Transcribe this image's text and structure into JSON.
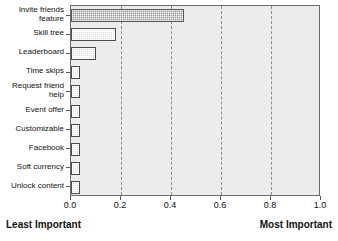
{
  "chart_data": {
    "type": "bar",
    "orientation": "horizontal",
    "title": "",
    "xlabel": "",
    "ylabel": "",
    "xlim": [
      0.0,
      1.0
    ],
    "grid": "vertical-dashed",
    "legend": "none",
    "xticks": [
      "0.0",
      "0.2",
      "0.4",
      "0.6",
      "0.8",
      "1.0"
    ],
    "xtick_values": [
      0.0,
      0.2,
      0.4,
      0.6,
      0.8,
      1.0
    ],
    "categories": [
      "Invite friends\nfeature",
      "Skill tree",
      "Leaderboard",
      "Time skips",
      "Request friend\nhelp",
      "Event offer",
      "Customizable",
      "Facebook",
      "Soft currency",
      "Unlock content"
    ],
    "values": [
      0.45,
      0.18,
      0.1,
      0.035,
      0.035,
      0.035,
      0.035,
      0.035,
      0.035,
      0.035
    ],
    "highlight_index": 0,
    "annotations": {
      "axis_low_label": "Least Important",
      "axis_high_label": "Most Important"
    },
    "colors": {
      "plot_background": "#ececed",
      "bar_fill_light": "#dedede",
      "bar_fill_highlight": "#9a9a9a",
      "bar_edge": "#4d4d4d",
      "gridline": "#8c8c8c",
      "axis": "#6d6d6d",
      "text": "#111111"
    }
  }
}
